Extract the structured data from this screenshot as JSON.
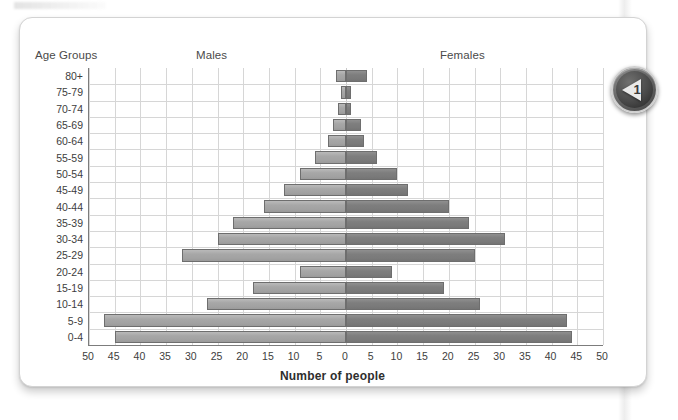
{
  "card": {
    "headers": {
      "age_groups": "Age Groups",
      "males": "Males",
      "females": "Females"
    }
  },
  "badge": {
    "number": "1",
    "icon": "play-left-triangle-icon"
  },
  "chart_data": {
    "type": "bar",
    "subtype": "population-pyramid",
    "title": "",
    "xlabel": "Number of people",
    "ylabel": "Age Groups",
    "orientation": "horizontal",
    "grid": true,
    "legend_position": "top",
    "xlim": [
      -50,
      50
    ],
    "xtick_values": [
      -50,
      -45,
      -40,
      -35,
      -30,
      -25,
      -20,
      -15,
      -10,
      -5,
      0,
      5,
      10,
      15,
      20,
      25,
      30,
      35,
      40,
      45,
      50
    ],
    "xtick_labels": [
      "50",
      "45",
      "40",
      "35",
      "30",
      "25",
      "20",
      "15",
      "10",
      "5",
      "0",
      "5",
      "10",
      "15",
      "20",
      "25",
      "30",
      "35",
      "40",
      "45",
      "50"
    ],
    "categories": [
      "80+",
      "75-79",
      "70-74",
      "65-69",
      "60-64",
      "55-59",
      "50-54",
      "45-49",
      "40-44",
      "35-39",
      "30-34",
      "25-29",
      "20-24",
      "15-19",
      "10-14",
      "5-9",
      "0-4"
    ],
    "series": [
      {
        "name": "Males",
        "side": "left",
        "color": "#a9a9a9",
        "values": [
          2,
          1,
          1.5,
          2.5,
          3.5,
          6,
          9,
          12,
          16,
          22,
          25,
          32,
          9,
          18,
          27,
          47,
          45
        ]
      },
      {
        "name": "Females",
        "side": "right",
        "color": "#7e7e7e",
        "values": [
          4,
          1,
          1,
          3,
          3.5,
          6,
          10,
          12,
          20,
          24,
          31,
          25,
          9,
          19,
          26,
          43,
          44
        ]
      }
    ]
  }
}
